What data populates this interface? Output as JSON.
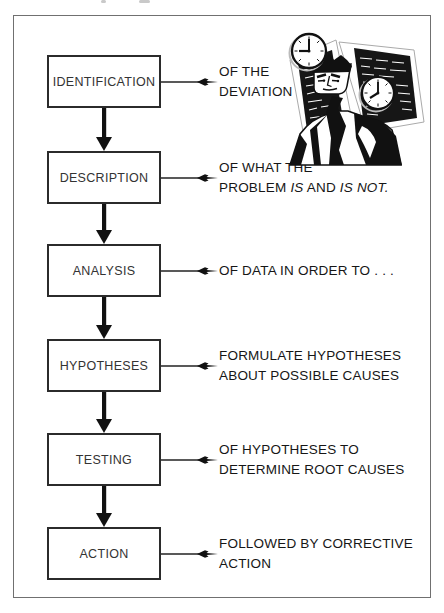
{
  "page": {
    "background_color": "#ffffff",
    "frame_border_color": "#707070",
    "ink_color": "#161616",
    "box_border_color": "#2b2b2b"
  },
  "flowchart": {
    "steps": [
      {
        "label": "IDENTIFICATION",
        "annotation": [
          [
            {
              "t": "OF THE"
            }
          ],
          [
            {
              "t": "DEVIATION"
            }
          ]
        ]
      },
      {
        "label": "DESCRIPTION",
        "annotation": [
          [
            {
              "t": "OF WHAT THE"
            }
          ],
          [
            {
              "t": "PROBLEM "
            },
            {
              "t": "IS",
              "italic": true
            },
            {
              "t": " AND "
            },
            {
              "t": "IS NOT.",
              "italic": true
            }
          ]
        ]
      },
      {
        "label": "ANALYSIS",
        "annotation": [
          [
            {
              "t": "OF DATA IN ORDER TO . . ."
            }
          ]
        ]
      },
      {
        "label": "HYPOTHESES",
        "annotation": [
          [
            {
              "t": "FORMULATE HYPOTHESES"
            }
          ],
          [
            {
              "t": "ABOUT POSSIBLE CAUSES"
            }
          ]
        ]
      },
      {
        "label": "TESTING",
        "annotation": [
          [
            {
              "t": "OF HYPOTHESES TO"
            }
          ],
          [
            {
              "t": "DETERMINE ROOT CAUSES"
            }
          ]
        ]
      },
      {
        "label": "ACTION",
        "annotation": [
          [
            {
              "t": "FOLLOWED BY CORRECTIVE"
            }
          ],
          [
            {
              "t": "ACTION"
            }
          ]
        ]
      }
    ]
  },
  "illustration": {
    "name": "worried-man-with-clocks-clipart",
    "clock1_time": "9:00",
    "clock2_time": "8:00"
  }
}
